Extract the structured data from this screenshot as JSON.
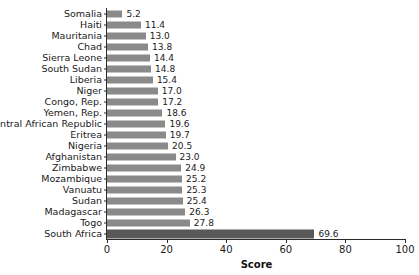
{
  "chart_data": {
    "type": "bar",
    "orientation": "horizontal",
    "title": "",
    "xlabel": "Score",
    "ylabel": "",
    "xlim": [
      0,
      100
    ],
    "xticks": [
      "0",
      "20",
      "40",
      "60",
      "80",
      "100"
    ],
    "grid": false,
    "legend": null,
    "highlight_category": "South Africa",
    "colors": {
      "bar": "#8a8a8a",
      "highlight_bar": "#585858",
      "axis": "#2b2b2b",
      "text": "#1a1a1a",
      "background": "#ffffff"
    },
    "categories": [
      "Somalia",
      "Haiti",
      "Mauritania",
      "Chad",
      "Sierra Leone",
      "South Sudan",
      "Liberia",
      "Niger",
      "Congo, Rep.",
      "Yemen, Rep.",
      "Central African Republic",
      "Eritrea",
      "Nigeria",
      "Afghanistan",
      "Zimbabwe",
      "Mozambique",
      "Vanuatu",
      "Sudan",
      "Madagascar",
      "Togo",
      "South Africa"
    ],
    "values": [
      5.2,
      11.4,
      13.0,
      13.8,
      14.4,
      14.8,
      15.4,
      17.0,
      17.2,
      18.6,
      19.6,
      19.7,
      20.5,
      23.0,
      24.9,
      25.2,
      25.3,
      25.4,
      26.3,
      27.8,
      69.6
    ],
    "value_labels": [
      "5.2",
      "11.4",
      "13.0",
      "13.8",
      "14.4",
      "14.8",
      "15.4",
      "17.0",
      "17.2",
      "18.6",
      "19.6",
      "19.7",
      "20.5",
      "23.0",
      "24.9",
      "25.2",
      "25.3",
      "25.4",
      "26.3",
      "27.8",
      "69.6"
    ]
  }
}
